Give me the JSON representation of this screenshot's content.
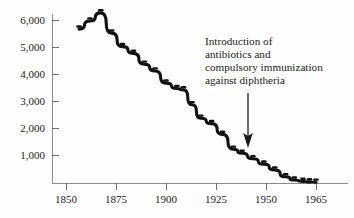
{
  "chart_data": {
    "type": "line",
    "title": "",
    "xlabel": "",
    "ylabel": "",
    "xlim": [
      1845,
      1968
    ],
    "ylim": [
      0,
      6600
    ],
    "grid": false,
    "legend": "none",
    "x_ticks": [
      1850,
      1875,
      1900,
      1925,
      1950,
      1965
    ],
    "x_tick_labels": [
      "1850",
      "1875",
      "1900",
      "1925",
      "1950",
      "1965"
    ],
    "y_ticks": [
      1000,
      2000,
      3000,
      4000,
      5000,
      6000
    ],
    "y_tick_labels": [
      "1,000",
      "2,000",
      "3,000",
      "4,000",
      "5,000",
      "6,000"
    ],
    "series": [
      {
        "name": "Diphtheria death rate",
        "x": [
          1856,
          1861,
          1866,
          1871,
          1876,
          1881,
          1886,
          1891,
          1896,
          1901,
          1904,
          1908,
          1912,
          1917,
          1922,
          1927,
          1931,
          1936,
          1941,
          1946,
          1951,
          1955,
          1959,
          1962,
          1965
        ],
        "values": [
          5700,
          6000,
          6300,
          5550,
          5050,
          4800,
          4400,
          4150,
          3700,
          3500,
          3450,
          2900,
          2400,
          2200,
          1800,
          1250,
          1100,
          900,
          700,
          480,
          230,
          110,
          60,
          40,
          30
        ]
      }
    ],
    "annotations": [
      {
        "name": "intervention-note",
        "lines": [
          "Introduction of",
          "antibiotics and",
          "compulsory immunization",
          "against diphtheria"
        ],
        "arrow": {
          "points_to_x": 1942,
          "direction": "down"
        }
      }
    ],
    "colors": {
      "line": "#111111",
      "axis": "#8a8a8a",
      "text": "#1a1a1a",
      "background": "#fefefe"
    }
  }
}
